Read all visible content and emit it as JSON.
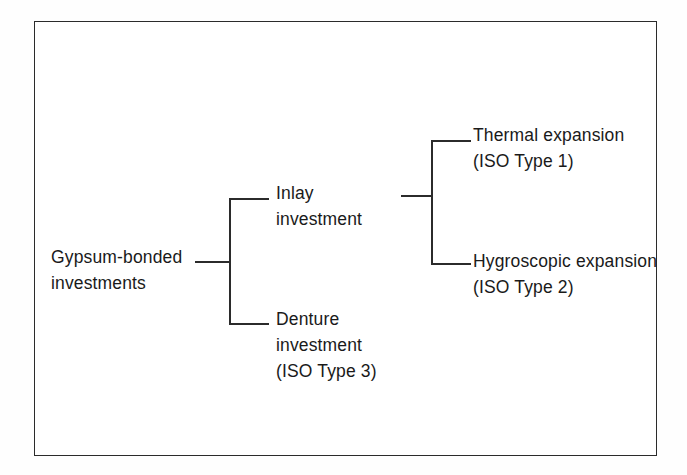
{
  "figure": {
    "frame_border_color": "#2b2b2b",
    "background_color": "#ffffff",
    "text_color": "#1a1a1a"
  },
  "diagram": {
    "type": "tree",
    "orientation": "left-to-right",
    "root": {
      "id": "gypsum-bonded-investments",
      "lines": [
        "Gypsum-bonded",
        "investments"
      ]
    },
    "level2": [
      {
        "id": "inlay-investment",
        "lines": [
          "Inlay",
          "investment"
        ]
      },
      {
        "id": "denture-investment",
        "lines": [
          "Denture",
          "investment",
          "(ISO Type 3)"
        ]
      }
    ],
    "level3": [
      {
        "id": "thermal-expansion",
        "lines": [
          "Thermal expansion",
          "(ISO Type 1)"
        ]
      },
      {
        "id": "hygroscopic-expansion",
        "lines": [
          "Hygroscopic expansion",
          "(ISO Type 2)"
        ]
      }
    ],
    "edges": [
      {
        "from": "gypsum-bonded-investments",
        "to": "inlay-investment"
      },
      {
        "from": "gypsum-bonded-investments",
        "to": "denture-investment"
      },
      {
        "from": "inlay-investment",
        "to": "thermal-expansion"
      },
      {
        "from": "inlay-investment",
        "to": "hygroscopic-expansion"
      }
    ]
  }
}
